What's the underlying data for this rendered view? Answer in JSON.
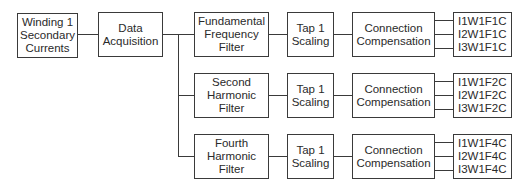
{
  "source": {
    "label": "Winding 1 Secondary Currents",
    "lines": [
      "Winding 1",
      "Secondary",
      "Currents"
    ]
  },
  "acquisition": {
    "label": "Data Acquisition",
    "lines": [
      "Data",
      "Acquisition"
    ]
  },
  "branches": [
    {
      "filter": {
        "lines": [
          "Fundamental",
          "Frequency",
          "Filter"
        ]
      },
      "scaling": {
        "lines": [
          "Tap 1",
          "Scaling"
        ]
      },
      "compensation": {
        "lines": [
          "Connection",
          "Compensation"
        ]
      },
      "outputs": [
        "I1W1F1C",
        "I2W1F1C",
        "I3W1F1C"
      ]
    },
    {
      "filter": {
        "lines": [
          "Second",
          "Harmonic",
          "Filter"
        ]
      },
      "scaling": {
        "lines": [
          "Tap 1",
          "Scaling"
        ]
      },
      "compensation": {
        "lines": [
          "Connection",
          "Compensation"
        ]
      },
      "outputs": [
        "I1W1F2C",
        "I2W1F2C",
        "I3W1F2C"
      ]
    },
    {
      "filter": {
        "lines": [
          "Fourth",
          "Harmonic",
          "Filter"
        ]
      },
      "scaling": {
        "lines": [
          "Tap 1",
          "Scaling"
        ]
      },
      "compensation": {
        "lines": [
          "Connection",
          "Compensation"
        ]
      },
      "outputs": [
        "I1W1F4C",
        "I2W1F4C",
        "I3W1F4C"
      ]
    }
  ],
  "colors": {
    "stroke": "#3a3a3a",
    "text": "#2a2a2a",
    "background": "#ffffff"
  }
}
